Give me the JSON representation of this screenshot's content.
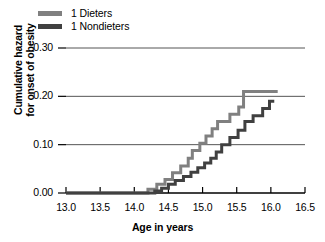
{
  "chart_data": {
    "type": "line",
    "subtype": "step",
    "title": "",
    "xlabel": "Age in years",
    "ylabel": "Cumulative hazard\nfor onset of obesity",
    "ylabel_lines": [
      "Cumulative hazard",
      "for onset of obesity"
    ],
    "xlim": [
      13.0,
      16.5
    ],
    "ylim": [
      0.0,
      0.3
    ],
    "xticks": [
      13.0,
      13.5,
      14.0,
      14.5,
      15.0,
      15.5,
      16.0,
      16.5
    ],
    "xtick_labels": [
      "13.0",
      "13.5",
      "14.0",
      "14.5",
      "15.0",
      "15.5",
      "16.0",
      "16.5"
    ],
    "yticks": [
      0.0,
      0.1,
      0.2,
      0.3
    ],
    "ytick_labels": [
      "0.00",
      "0.10",
      "0.20",
      "0.30"
    ],
    "grid": "horizontal",
    "legend_position": "above-left",
    "series": [
      {
        "name": "1 Dieters",
        "color": "#808080",
        "line_width": 3,
        "points": [
          [
            13.0,
            0.0
          ],
          [
            14.2,
            0.0
          ],
          [
            14.2,
            0.008
          ],
          [
            14.33,
            0.008
          ],
          [
            14.33,
            0.018
          ],
          [
            14.45,
            0.018
          ],
          [
            14.45,
            0.028
          ],
          [
            14.56,
            0.028
          ],
          [
            14.56,
            0.042
          ],
          [
            14.68,
            0.042
          ],
          [
            14.68,
            0.056
          ],
          [
            14.79,
            0.056
          ],
          [
            14.79,
            0.072
          ],
          [
            14.85,
            0.072
          ],
          [
            14.85,
            0.088
          ],
          [
            14.96,
            0.088
          ],
          [
            14.96,
            0.103
          ],
          [
            15.05,
            0.103
          ],
          [
            15.05,
            0.118
          ],
          [
            15.14,
            0.118
          ],
          [
            15.14,
            0.133
          ],
          [
            15.22,
            0.133
          ],
          [
            15.22,
            0.148
          ],
          [
            15.4,
            0.148
          ],
          [
            15.4,
            0.163
          ],
          [
            15.53,
            0.163
          ],
          [
            15.53,
            0.178
          ],
          [
            15.6,
            0.178
          ],
          [
            15.6,
            0.21
          ],
          [
            16.1,
            0.21
          ]
        ]
      },
      {
        "name": "1 Nondieters",
        "color": "#404040",
        "line_width": 3,
        "points": [
          [
            13.0,
            0.0
          ],
          [
            14.3,
            0.0
          ],
          [
            14.3,
            0.004
          ],
          [
            14.4,
            0.004
          ],
          [
            14.4,
            0.01
          ],
          [
            14.5,
            0.01
          ],
          [
            14.5,
            0.018
          ],
          [
            14.6,
            0.018
          ],
          [
            14.6,
            0.026
          ],
          [
            14.72,
            0.026
          ],
          [
            14.72,
            0.034
          ],
          [
            14.83,
            0.034
          ],
          [
            14.83,
            0.043
          ],
          [
            14.93,
            0.043
          ],
          [
            14.93,
            0.052
          ],
          [
            15.03,
            0.052
          ],
          [
            15.03,
            0.062
          ],
          [
            15.12,
            0.062
          ],
          [
            15.12,
            0.072
          ],
          [
            15.2,
            0.072
          ],
          [
            15.2,
            0.085
          ],
          [
            15.28,
            0.085
          ],
          [
            15.28,
            0.1
          ],
          [
            15.4,
            0.1
          ],
          [
            15.4,
            0.115
          ],
          [
            15.52,
            0.115
          ],
          [
            15.52,
            0.13
          ],
          [
            15.62,
            0.13
          ],
          [
            15.62,
            0.148
          ],
          [
            15.74,
            0.148
          ],
          [
            15.74,
            0.16
          ],
          [
            15.88,
            0.16
          ],
          [
            15.88,
            0.175
          ],
          [
            15.98,
            0.175
          ],
          [
            15.98,
            0.19
          ],
          [
            16.05,
            0.19
          ]
        ]
      }
    ]
  },
  "legend": {
    "items": [
      {
        "label": "1 Dieters",
        "color": "#808080"
      },
      {
        "label": "1 Nondieters",
        "color": "#404040"
      }
    ]
  },
  "axes": {
    "x_title": "Age in years",
    "y_title_line1": "Cumulative hazard",
    "y_title_line2": "for onset of obesity",
    "x_labels": [
      "13.0",
      "13.5",
      "14.0",
      "14.5",
      "15.0",
      "15.5",
      "16.0",
      "16.5"
    ],
    "y_labels": [
      "0.30",
      "0.20",
      "0.10",
      "0.00"
    ]
  },
  "colors": {
    "background": "#ffffff",
    "axis": "#000000",
    "grid": "#555555",
    "series_dieters": "#808080",
    "series_nondieters": "#404040"
  }
}
